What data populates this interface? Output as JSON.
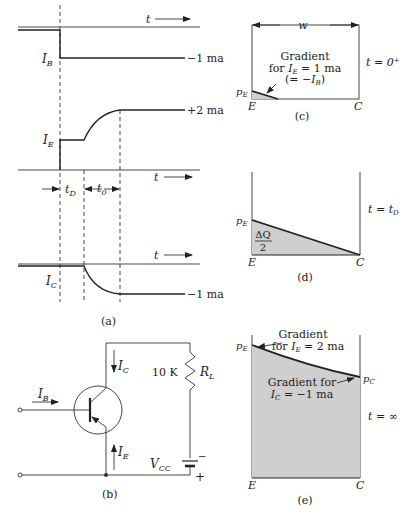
{
  "figure": {
    "panel_a": {
      "caption": "(a)",
      "time_axis_label": "t",
      "IB": {
        "label": "I",
        "sub": "B",
        "final_value": "−1 ma"
      },
      "IE": {
        "label": "I",
        "sub": "E",
        "final_value": "+2 ma"
      },
      "IC": {
        "label": "I",
        "sub": "C",
        "final_value": "−1 ma"
      },
      "interval_tD": {
        "label": "t",
        "sub": "D"
      },
      "interval_t0": {
        "label": "t",
        "sub": "0"
      }
    },
    "panel_b": {
      "caption": "(b)",
      "IB": {
        "label": "I",
        "sub": "B"
      },
      "IC": {
        "label": "I",
        "sub": "C"
      },
      "IE": {
        "label": "I",
        "sub": "E"
      },
      "resistor_value": "10 K",
      "resistor_name": {
        "label": "R",
        "sub": "L"
      },
      "supply": {
        "label": "V",
        "sub": "CC"
      },
      "plus": "+",
      "minus": "−"
    },
    "panel_c": {
      "caption": "(c)",
      "width_label": "w",
      "time_label": "t = 0⁺",
      "gradient_line1": "Gradient",
      "gradient_line2_pre": "for ",
      "gradient_line2_var": "I",
      "gradient_line2_sub": "E",
      "gradient_line2_post": " = 1 ma",
      "gradient_line3_pre": "(= −",
      "gradient_line3_var": "I",
      "gradient_line3_sub": "B",
      "gradient_line3_post": ")",
      "pE": {
        "label": "p",
        "sub": "E"
      },
      "E": "E",
      "C": "C"
    },
    "panel_d": {
      "caption": "(d)",
      "time_label_pre": "t = t",
      "time_label_sub": "D",
      "charge_num": "ΔQ",
      "charge_den": "2",
      "pE": {
        "label": "p",
        "sub": "E"
      },
      "E": "E",
      "C": "C"
    },
    "panel_e": {
      "caption": "(e)",
      "time_label": "t = ∞",
      "gradE_line1": "Gradient",
      "gradE_line2_pre": "for ",
      "gradE_line2_var": "I",
      "gradE_line2_sub": "E",
      "gradE_line2_post": " = 2 ma",
      "gradC_line1": "Gradient for",
      "gradC_line2_var": "I",
      "gradC_line2_sub": "C",
      "gradC_line2_post": " =  −1 ma",
      "pE": {
        "label": "p",
        "sub": "E"
      },
      "pC": {
        "label": "p",
        "sub": "C"
      },
      "E": "E",
      "C": "C"
    }
  }
}
